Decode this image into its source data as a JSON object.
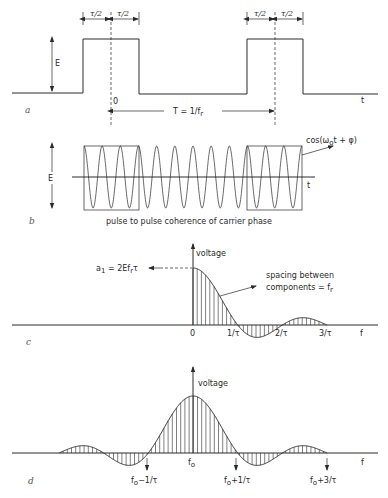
{
  "figure": {
    "panel_a": {
      "label": "a",
      "amplitude_label": "E",
      "half_width_label_1": "τ/2",
      "half_width_label_2": "τ/2",
      "half_width_label_3": "τ/2",
      "half_width_label_4": "τ/2",
      "origin_label": "0",
      "period_label": "T = 1/f",
      "period_subscript": "r",
      "time_axis_label": "t"
    },
    "panel_b": {
      "label": "b",
      "amplitude_label": "E",
      "carrier_label": "cos(ω",
      "carrier_subscript": "o",
      "carrier_label_tail": "t + φ)",
      "time_axis_label": "t",
      "caption": "pulse to pulse coherence of carrier phase",
      "cycles": 12
    },
    "panel_c": {
      "label": "c",
      "y_axis_label": "voltage",
      "peak_annotation": "a",
      "peak_annotation_sub": "1",
      "peak_annotation_tail": " = 2Ef",
      "peak_annotation_sub2": "r",
      "peak_annotation_end": "τ",
      "spacing_line1": "spacing between",
      "spacing_line2": "components = f",
      "spacing_subscript": "r",
      "x_ticks": [
        "0",
        "1/τ",
        "2/τ",
        "3/τ"
      ],
      "x_axis_label": "f"
    },
    "panel_d": {
      "label": "d",
      "y_axis_label": "voltage",
      "center_label": "f",
      "center_subscript": "o",
      "markers": [
        {
          "base": "f",
          "sub": "o",
          "tail": "−1/τ"
        },
        {
          "base": "f",
          "sub": "o",
          "tail": "+1/τ"
        },
        {
          "base": "f",
          "sub": "o",
          "tail": "+3/τ"
        }
      ],
      "x_axis_label": "f"
    }
  }
}
